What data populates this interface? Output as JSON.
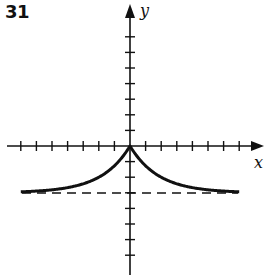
{
  "problem_number": "31",
  "axes": {
    "x_label": "x",
    "y_label": "y",
    "x_ticks_each_side": 7,
    "y_ticks_each_side": 7
  },
  "curve": {
    "description": "Graph with sharp peak at origin, decreasing symmetrically toward horizontal asymptote",
    "peak": [
      0,
      0
    ],
    "asymptote_y": -3,
    "x_range": [
      -7,
      7
    ]
  },
  "colors": {
    "ink": "#111111",
    "background": "#ffffff"
  }
}
